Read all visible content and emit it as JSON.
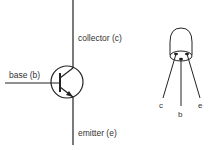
{
  "diagram": {
    "colors": {
      "stroke": "#222222",
      "text": "#333333",
      "background": "#ffffff"
    },
    "symbol": {
      "labels": {
        "collector": "collector (c)",
        "base": "base (b)",
        "emitter": "emitter (e)"
      }
    },
    "package": {
      "pins": {
        "c": "c",
        "b": "b",
        "e": "e"
      }
    }
  }
}
